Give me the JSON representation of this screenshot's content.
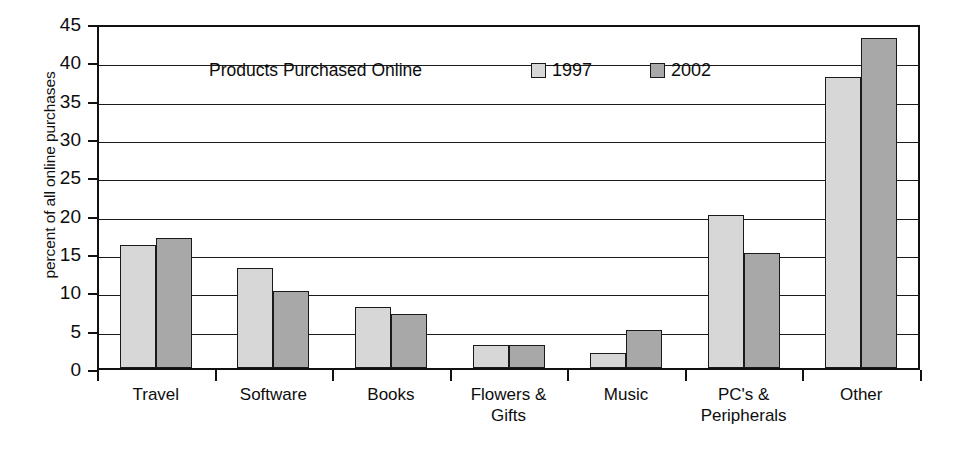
{
  "chart_data": {
    "type": "bar",
    "title": "Products Purchased Online",
    "xlabel": "",
    "ylabel": "percent of all online purchases",
    "ylim": [
      0,
      45
    ],
    "ytick_step": 5,
    "yticks": [
      "0",
      "5",
      "10",
      "15",
      "20",
      "25",
      "30",
      "35",
      "40",
      "45"
    ],
    "grid": true,
    "legend_position": "inside-top-center",
    "categories": [
      "Travel",
      "Software",
      "Books",
      "Flowers &\nGifts",
      "Music",
      "PC's &\nPeripherals",
      "Other"
    ],
    "series": [
      {
        "name": "1997",
        "color": "#d7d7d7",
        "values": [
          16,
          13,
          8,
          3,
          2,
          20,
          38
        ]
      },
      {
        "name": "2002",
        "color": "#a8a8a8",
        "values": [
          17,
          10,
          7,
          3,
          5,
          15,
          43
        ]
      }
    ]
  }
}
